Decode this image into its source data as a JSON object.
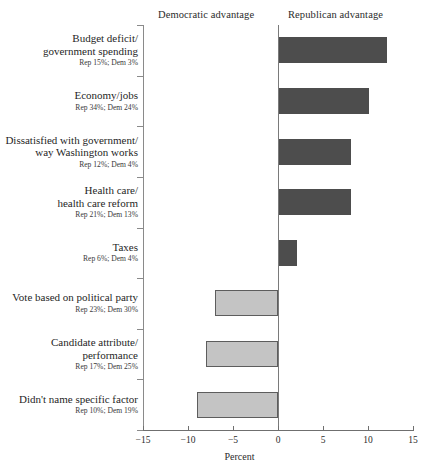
{
  "header": {
    "democratic_advantage": "Democratic advantage",
    "republican_advantage": "Republican advantage"
  },
  "axis": {
    "title": "Percent",
    "ticks": [
      "−15",
      "−10",
      "−5",
      "0",
      "5",
      "10",
      "15"
    ],
    "tick_values": [
      -15,
      -10,
      -5,
      0,
      5,
      10,
      15
    ]
  },
  "colors": {
    "positive_bar": "#4d4d4d",
    "negative_bar": "#c4c4c4",
    "negative_bar_border": "#5d5d5d",
    "axis": "#6f6f6f",
    "text": "#2b2b2b"
  },
  "chart_data": {
    "type": "bar",
    "orientation": "horizontal",
    "title": "",
    "xlabel": "Percent",
    "ylabel": "",
    "xlim": [
      -15,
      15
    ],
    "grid": false,
    "legend": "none",
    "zero_reference": 0,
    "annotations": [
      "Democratic advantage",
      "Republican advantage"
    ],
    "categories": [
      "Budget deficit/ government spending",
      "Economy/jobs",
      "Dissatisfied with government/ way Washington works",
      "Health care/ health care reform",
      "Taxes",
      "Vote based on political party",
      "Candidate attribute/ performance",
      "Didn't name specific factor"
    ],
    "values": [
      12,
      10,
      8,
      8,
      2,
      -7,
      -8,
      -9
    ],
    "series": [
      {
        "name": "Republican percent",
        "values": [
          15,
          34,
          12,
          21,
          6,
          23,
          17,
          10
        ]
      },
      {
        "name": "Democratic percent",
        "values": [
          3,
          24,
          4,
          13,
          4,
          30,
          25,
          19
        ]
      }
    ]
  },
  "rows": [
    {
      "name_line1": "Budget deficit/",
      "name_line2": "government spending",
      "sub": "Rep 15%; Dem 3%",
      "value": 12
    },
    {
      "name_line1": "Economy/jobs",
      "name_line2": "",
      "sub": "Rep 34%; Dem 24%",
      "value": 10
    },
    {
      "name_line1": "Dissatisfied with government/",
      "name_line2": "way Washington works",
      "sub": "Rep 12%; Dem 4%",
      "value": 8
    },
    {
      "name_line1": "Health care/",
      "name_line2": "health care reform",
      "sub": "Rep 21%; Dem 13%",
      "value": 8
    },
    {
      "name_line1": "Taxes",
      "name_line2": "",
      "sub": "Rep 6%; Dem 4%",
      "value": 2
    },
    {
      "name_line1": "Vote based on political party",
      "name_line2": "",
      "sub": "Rep 23%; Dem 30%",
      "value": -7
    },
    {
      "name_line1": "Candidate attribute/",
      "name_line2": "performance",
      "sub": "Rep 17%; Dem 25%",
      "value": -8
    },
    {
      "name_line1": "Didn't name specific factor",
      "name_line2": "",
      "sub": "Rep 10%; Dem 19%",
      "value": -9
    }
  ]
}
